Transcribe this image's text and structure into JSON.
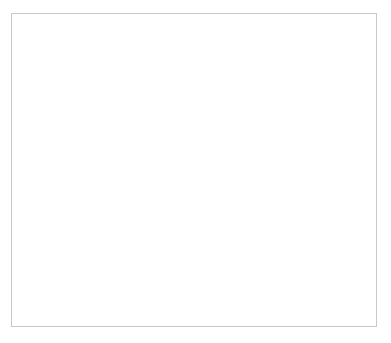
{
  "chart_data": {
    "type": "line",
    "title": "",
    "xlabel": "Sample Size per Group",
    "ylabel": "Statistical Power",
    "xlim": [
      2,
      52
    ],
    "ylim": [
      0.0,
      1.04
    ],
    "xticks": [
      10,
      20,
      30,
      40,
      50
    ],
    "xtick_labels": [
      "10",
      "20",
      "30",
      "40",
      "50"
    ],
    "yticks": [
      0.0,
      0.2,
      0.4,
      0.6,
      0.8,
      1.0
    ],
    "ytick_labels": [
      "0.0",
      "0.2",
      "0.4",
      "0.6",
      "0.8",
      "1.0"
    ],
    "grid": false,
    "legend_position": "bottom-right",
    "reference_lines": [
      {
        "name": "power-threshold",
        "orientation": "horizontal",
        "y": 0.8,
        "style": "solid"
      }
    ],
    "x": [
      2,
      4,
      6,
      8,
      10,
      12,
      14,
      16,
      18,
      20,
      22,
      24,
      26,
      28,
      30,
      32,
      34,
      36,
      38,
      40,
      42,
      44,
      46,
      48,
      50
    ],
    "series": [
      {
        "name": "Reliability = 1.0 (Effect Size = 0.67)",
        "reliability": "1.0",
        "effect_size": "0.67",
        "style": "solid",
        "values": [
          0.118,
          0.205,
          0.292,
          0.374,
          0.45,
          0.519,
          0.581,
          0.637,
          0.686,
          0.729,
          0.767,
          0.8,
          0.829,
          0.853,
          0.875,
          0.893,
          0.908,
          0.921,
          0.932,
          0.942,
          0.95,
          0.957,
          0.963,
          0.968,
          0.972
        ]
      },
      {
        "name": "Reliability = 0.8 (Effect Size = 0.60)",
        "reliability": "0.8",
        "effect_size": "0.60",
        "style": "dashed",
        "values": [
          0.107,
          0.176,
          0.247,
          0.316,
          0.381,
          0.442,
          0.498,
          0.55,
          0.597,
          0.64,
          0.679,
          0.713,
          0.744,
          0.772,
          0.796,
          0.818,
          0.837,
          0.854,
          0.868,
          0.881,
          0.893,
          0.903,
          0.912,
          0.92,
          0.927
        ]
      },
      {
        "name": "Reliability = 0.5 (Effect Size = 0.47)",
        "reliability": "0.5",
        "effect_size": "0.47",
        "style": "dashdot",
        "values": [
          0.09,
          0.134,
          0.18,
          0.226,
          0.272,
          0.317,
          0.36,
          0.402,
          0.442,
          0.48,
          0.516,
          0.55,
          0.581,
          0.611,
          0.639,
          0.665,
          0.689,
          0.711,
          0.732,
          0.751,
          0.768,
          0.784,
          0.799,
          0.813,
          0.825
        ]
      }
    ]
  },
  "legend": {
    "entries": [
      "Reliability = 1.0 (Effect Size = 0.67)",
      "Reliability = 0.8 (Effect Size = 0.60)",
      "Reliability = 0.5 (Effect Size = 0.47)"
    ]
  },
  "colors": {
    "background": "#ffffff",
    "axis": "#8c8c8c",
    "curve": "#2e2e2e",
    "reference_line": "#7a7a7a",
    "frame": "#c8c8c8",
    "text": "#3c3c3c"
  }
}
